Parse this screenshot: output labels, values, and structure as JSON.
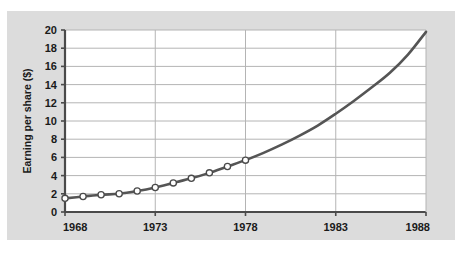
{
  "figure": {
    "panel_bg": "#dcdcdc",
    "plot_bg": "#ffffff",
    "gridline_color": "#b4b4b4",
    "axis_color": "#4a4a4a",
    "line_color": "#555555",
    "marker_fill": "#ffffff",
    "marker_edge": "#4a4a4a"
  },
  "chart_data": {
    "type": "line",
    "title": "",
    "xlabel": "",
    "ylabel": "Earning per share ($)",
    "xlim": [
      1968,
      1988
    ],
    "ylim": [
      0,
      20
    ],
    "xticks": [
      1968,
      1973,
      1978,
      1983,
      1988
    ],
    "xtick_labels": [
      "1968",
      "1973",
      "1978",
      "1983",
      "1988"
    ],
    "yticks": [
      0,
      2,
      4,
      6,
      8,
      10,
      12,
      14,
      16,
      18,
      20
    ],
    "ytick_labels": [
      "0",
      "2",
      "4",
      "6",
      "8",
      "10",
      "12",
      "14",
      "16",
      "18",
      "20"
    ],
    "grid": true,
    "grid_axis": "both",
    "legend": false,
    "series": [
      {
        "name": "Earning per share",
        "markers": true,
        "marker_x_range": [
          1968,
          1978
        ],
        "x": [
          1968,
          1969,
          1970,
          1971,
          1972,
          1973,
          1974,
          1975,
          1976,
          1977,
          1978,
          1979,
          1980,
          1981,
          1982,
          1983,
          1984,
          1985,
          1986,
          1987,
          1988
        ],
        "values": [
          1.5,
          1.7,
          1.9,
          2.0,
          2.3,
          2.7,
          3.2,
          3.7,
          4.3,
          5.0,
          5.7,
          6.5,
          7.4,
          8.4,
          9.5,
          10.8,
          12.2,
          13.7,
          15.3,
          17.3,
          19.8
        ]
      }
    ]
  }
}
